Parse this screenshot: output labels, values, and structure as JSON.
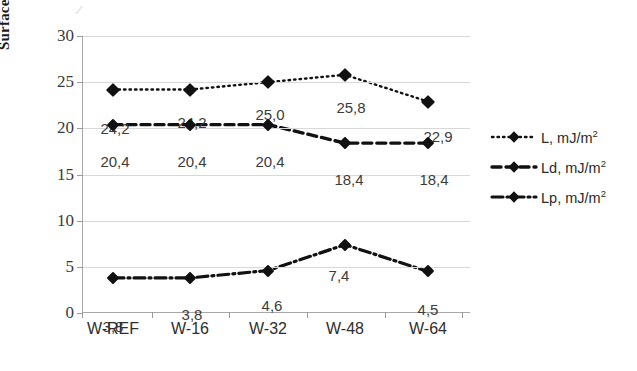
{
  "chart_data": {
    "type": "line",
    "title": "",
    "xlabel": "",
    "ylabel": "Surface energy [mJ/m2]",
    "ylabel_text": "Surface energy [mJ/m",
    "ylabel_sup": "2",
    "ylabel_tail": "]",
    "categories": [
      "W-REF",
      "W-16",
      "W-32",
      "W-48",
      "W-64"
    ],
    "ylim": [
      0,
      30
    ],
    "ytick_values": [
      30,
      25,
      20,
      15,
      10,
      5,
      0
    ],
    "ytick_labels": [
      "30",
      "25",
      "20",
      "15",
      "10",
      "5",
      "0"
    ],
    "grid": true,
    "legend_position": "right",
    "decimal_separator": ",",
    "series": [
      {
        "name": "L, mJ/m2",
        "legend_text": "L, mJ/m",
        "legend_sup": "2",
        "key": "L",
        "linestyle": "dotted",
        "marker": "diamond",
        "color": "#111111",
        "values": [
          24.2,
          24.2,
          25.0,
          25.8,
          22.9
        ],
        "labels": [
          "24,2",
          "24,2",
          "25,0",
          "25,8",
          "22,9"
        ]
      },
      {
        "name": "Ld, mJ/m2",
        "legend_text": "Ld, mJ/m",
        "legend_sup": "2",
        "key": "Ld",
        "linestyle": "dashed",
        "marker": "diamond",
        "color": "#111111",
        "values": [
          20.4,
          20.4,
          20.4,
          18.4,
          18.4
        ],
        "labels": [
          "20,4",
          "20,4",
          "20,4",
          "18,4",
          "18,4"
        ]
      },
      {
        "name": "Lp, mJ/m2",
        "legend_text": "Lp, mJ/m",
        "legend_sup": "2",
        "key": "Lp",
        "linestyle": "dashdot",
        "marker": "diamond",
        "color": "#111111",
        "values": [
          3.8,
          3.8,
          4.6,
          7.4,
          4.5
        ],
        "labels": [
          "3,8",
          "3,8",
          "4,6",
          "7,4",
          "4,5"
        ]
      }
    ]
  },
  "axis": {
    "y_title_full": "Surface energy [mJ/m2]"
  }
}
